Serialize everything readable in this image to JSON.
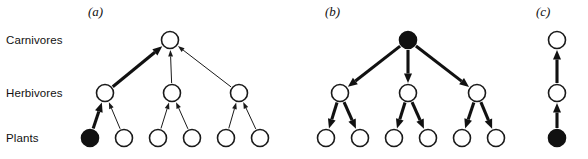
{
  "figure": {
    "background_color": "#ffffff",
    "ink_color": "#111111",
    "node_open_fill": "#ffffff",
    "node_filled_fill": "#111111",
    "row_labels": [
      {
        "id": "carnivores",
        "text": "Carnivores",
        "x": 6,
        "y": 34
      },
      {
        "id": "herbivores",
        "text": "Herbivores",
        "x": 6,
        "y": 87
      },
      {
        "id": "plants",
        "text": "Plants",
        "x": 6,
        "y": 132
      }
    ],
    "panel_labels": [
      {
        "id": "a",
        "text": "(a)",
        "x": 88,
        "y": 4
      },
      {
        "id": "b",
        "text": "(b)",
        "x": 325,
        "y": 4
      },
      {
        "id": "c",
        "text": "(c)",
        "x": 536,
        "y": 4
      }
    ],
    "rows": {
      "carnivores_y": 40,
      "herbivores_y": 93,
      "plants_y": 138
    },
    "node_radius": 8.5,
    "panels": [
      {
        "id": "a",
        "label": "(a)",
        "direction": "bottom-up",
        "description": "Bottom-up control: one filled plant node with a thick arrow chain upward",
        "nodes": [
          {
            "id": "a-c1",
            "level": "carnivores",
            "x": 170,
            "y": 40,
            "filled": false
          },
          {
            "id": "a-h1",
            "level": "herbivores",
            "x": 105,
            "y": 93,
            "filled": false
          },
          {
            "id": "a-h2",
            "level": "herbivores",
            "x": 172,
            "y": 93,
            "filled": false
          },
          {
            "id": "a-h3",
            "level": "herbivores",
            "x": 239,
            "y": 93,
            "filled": false
          },
          {
            "id": "a-p1",
            "level": "plants",
            "x": 90,
            "y": 138,
            "filled": true
          },
          {
            "id": "a-p2",
            "level": "plants",
            "x": 124,
            "y": 138,
            "filled": false
          },
          {
            "id": "a-p3",
            "level": "plants",
            "x": 158,
            "y": 138,
            "filled": false
          },
          {
            "id": "a-p4",
            "level": "plants",
            "x": 192,
            "y": 138,
            "filled": false
          },
          {
            "id": "a-p5",
            "level": "plants",
            "x": 226,
            "y": 138,
            "filled": false
          },
          {
            "id": "a-p6",
            "level": "plants",
            "x": 260,
            "y": 138,
            "filled": false
          }
        ],
        "edges": [
          {
            "from": "a-p1",
            "to": "a-h1",
            "weight": "thick"
          },
          {
            "from": "a-p2",
            "to": "a-h1",
            "weight": "thin"
          },
          {
            "from": "a-p3",
            "to": "a-h2",
            "weight": "thin"
          },
          {
            "from": "a-p4",
            "to": "a-h2",
            "weight": "thin"
          },
          {
            "from": "a-p5",
            "to": "a-h3",
            "weight": "thin"
          },
          {
            "from": "a-p6",
            "to": "a-h3",
            "weight": "thin"
          },
          {
            "from": "a-h1",
            "to": "a-c1",
            "weight": "thick"
          },
          {
            "from": "a-h2",
            "to": "a-c1",
            "weight": "thin"
          },
          {
            "from": "a-h3",
            "to": "a-c1",
            "weight": "thin"
          }
        ]
      },
      {
        "id": "b",
        "label": "(b)",
        "direction": "top-down",
        "description": "Top-down control: filled carnivore node with thick arrows cascading downward",
        "nodes": [
          {
            "id": "b-c1",
            "level": "carnivores",
            "x": 408,
            "y": 40,
            "filled": true
          },
          {
            "id": "b-h1",
            "level": "herbivores",
            "x": 340,
            "y": 93,
            "filled": false
          },
          {
            "id": "b-h2",
            "level": "herbivores",
            "x": 408,
            "y": 93,
            "filled": false
          },
          {
            "id": "b-h3",
            "level": "herbivores",
            "x": 477,
            "y": 93,
            "filled": false
          },
          {
            "id": "b-p1",
            "level": "plants",
            "x": 326,
            "y": 138,
            "filled": false
          },
          {
            "id": "b-p2",
            "level": "plants",
            "x": 360,
            "y": 138,
            "filled": false
          },
          {
            "id": "b-p3",
            "level": "plants",
            "x": 394,
            "y": 138,
            "filled": false
          },
          {
            "id": "b-p4",
            "level": "plants",
            "x": 428,
            "y": 138,
            "filled": false
          },
          {
            "id": "b-p5",
            "level": "plants",
            "x": 462,
            "y": 138,
            "filled": false
          },
          {
            "id": "b-p6",
            "level": "plants",
            "x": 496,
            "y": 138,
            "filled": false
          }
        ],
        "edges": [
          {
            "from": "b-c1",
            "to": "b-h1",
            "weight": "thick"
          },
          {
            "from": "b-c1",
            "to": "b-h2",
            "weight": "thick"
          },
          {
            "from": "b-c1",
            "to": "b-h3",
            "weight": "thick"
          },
          {
            "from": "b-h1",
            "to": "b-p1",
            "weight": "thick"
          },
          {
            "from": "b-h1",
            "to": "b-p2",
            "weight": "thick"
          },
          {
            "from": "b-h2",
            "to": "b-p3",
            "weight": "thick"
          },
          {
            "from": "b-h2",
            "to": "b-p4",
            "weight": "thick"
          },
          {
            "from": "b-h3",
            "to": "b-p5",
            "weight": "thick"
          },
          {
            "from": "b-h3",
            "to": "b-p6",
            "weight": "thick"
          }
        ]
      },
      {
        "id": "c",
        "label": "(c)",
        "direction": "bottom-up",
        "description": "Single linear chain: filled plant node feeding upward through herbivore to carnivore",
        "nodes": [
          {
            "id": "c-c1",
            "level": "carnivores",
            "x": 557,
            "y": 40,
            "filled": false
          },
          {
            "id": "c-h1",
            "level": "herbivores",
            "x": 557,
            "y": 93,
            "filled": false
          },
          {
            "id": "c-p1",
            "level": "plants",
            "x": 557,
            "y": 138,
            "filled": true
          }
        ],
        "edges": [
          {
            "from": "c-p1",
            "to": "c-h1",
            "weight": "thick"
          },
          {
            "from": "c-h1",
            "to": "c-c1",
            "weight": "thick"
          }
        ]
      }
    ]
  }
}
